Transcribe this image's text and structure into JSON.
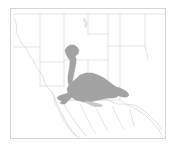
{
  "figure": {
    "kind": "distribution-range-map",
    "title": "",
    "caption": "",
    "width_px": 174,
    "height_px": 146,
    "background_color": "#ffffff"
  },
  "frame": {
    "visible": true,
    "color": "#d5d5d8",
    "x": 10,
    "y": 8,
    "width": 155,
    "height": 130
  },
  "colors": {
    "background": "#ffffff",
    "frame_border": "#d5d5d8",
    "political_boundary": "#dcdcdc",
    "coastline": "#d8d8d8",
    "range_fill": "#a3a3a3",
    "range_outline": "#9a9a9a",
    "range_fill_light": "#c9c9c9",
    "speck": "#e2e2e2"
  },
  "legend": {
    "visible": false,
    "entries": []
  },
  "axes": {
    "visible": false,
    "tick_labels": []
  },
  "labels": {
    "visible": false,
    "items": []
  },
  "regions": {
    "shaded_range_name": "shaded-distribution-range",
    "extent_description": "southwestern United States and northwestern Mexico",
    "notes": ""
  },
  "map_geometry": {
    "outer_frame": "M10,8 L165,8 L165,138 L10,138 Z",
    "pacific_coast": "M14,18 L17,26 L16,33 L19,38 L22,44 L27,50 L30,56 L33,60 L36,66 L40,72 L43,76 L44,82 L48,88 L52,92",
    "baja_peninsula": "M52,92 L55,98 L57,104 L60,110 L63,116 L66,122 L70,128 L74,133 L78,137 L80,138 M52,92 L54,97 L55,103 L58,109 L61,115 L64,121 L68,127 L72,132 L76,136",
    "gulf_of_california": "M60,96 L63,102 L66,108 L70,114 L74,120 L78,126 L82,131 L86,136",
    "us_canada_north_edge": "M14,14 L165,14",
    "state_lines": [
      "M40,14 L40,47 L14,47",
      "M40,47 L40,62 L64,62",
      "M64,14 L64,62",
      "M64,62 L64,86",
      "M64,86 L40,86",
      "M40,62 L40,86",
      "M88,14 L88,34",
      "M88,34 L108,34",
      "M108,14 L108,34",
      "M108,34 L108,60",
      "M64,60 L108,60",
      "M108,60 L108,100",
      "M88,60 L88,100",
      "M64,100 L108,100",
      "M108,100 L120,100",
      "M120,14 L120,46",
      "M108,46 L145,46",
      "M145,14 L145,46",
      "M145,46 L148,60",
      "M120,46 L120,100",
      "M120,100 L126,104 L134,105 L140,108 L146,112 L152,118 L158,124 L162,130",
      "M108,100 L112,102 L114,104"
    ],
    "mexico_border": "M64,100 L108,100 L112,102 L118,104 L124,104 L130,106 L136,109 L142,113 L148,118 L154,124 L159,130 L162,136",
    "mexico_interior": [
      "M80,104 L84,112 L88,120 L92,128 L96,134",
      "M96,108 L100,116 L104,124 L108,131",
      "M112,106 L116,114 L120,122 L124,130",
      "M130,110 L132,118 L134,126"
    ],
    "range_main": "M76,79 L80,75 L86,73 L92,73 L98,75 L104,78 L108,81 L112,84 L116,87 L118,90 L119,94 L117,97 L113,98 L108,98 L103,99 L98,100 L94,101 L89,102 L84,102 L80,101 L76,100 L73,98 L70,96 L68,93 L67,89 L69,85 L72,82 Z",
    "range_north_neck": "M71,56 L74,55 L76,58 L76,63 L75,68 L74,73 L73,78 L72,82 L69,85 L68,82 L68,76 L69,70 L70,64 L70,60 Z",
    "range_north_cap": "M67,47 L70,45 L74,45 L77,47 L79,50 L78,54 L75,56 L71,56 L70,60 L68,58 L66,54 L65,50 Z",
    "range_west_spur": "M68,93 L65,94 L62,95 L59,96 L57,98 L59,100 L62,101 L60,103 L62,104 L65,104 L67,102 L69,100 L71,98 L73,96 L70,96 Z",
    "range_east_tip": "M116,87 L120,88 L124,90 L127,92 L129,95 L127,97 L123,97 L119,96 L117,94 L118,90 Z",
    "range_south_lobe": "M84,102 L88,104 L92,106 L96,107 L100,107 L103,106 L101,104 L97,103 L92,102 L88,101 Z",
    "speck_marks": [
      "M83,19 L85,18 L86,21 L84,23 Z",
      "M85,22 L87,21 L88,24 L86,26 Z",
      "M84,25 L86,24 L87,27 L85,28 Z"
    ]
  }
}
